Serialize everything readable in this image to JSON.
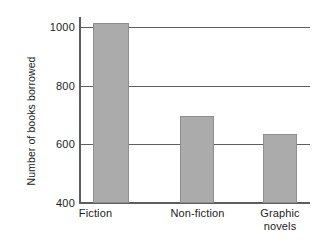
{
  "chart_data": {
    "type": "bar",
    "title": "",
    "xlabel": "",
    "ylabel": "Number of books borrowed",
    "categories": [
      "Fiction",
      "Non-fiction",
      "Graphic novels"
    ],
    "category_lines": [
      [
        "Fiction"
      ],
      [
        "Non-fiction"
      ],
      [
        "Graphic",
        "novels"
      ]
    ],
    "values": [
      1015,
      695,
      635
    ],
    "ylim": [
      400,
      1060
    ],
    "yticks": [
      400,
      600,
      800,
      1000
    ],
    "ytick_labels": [
      "400",
      "600",
      "800",
      "1000"
    ],
    "grid": true,
    "grid_axis": "y",
    "legend": false,
    "legend_position": "none",
    "bar_color": "#ababab",
    "bar_edge_color": "#8e8e8e",
    "axis_color": "#5e5e5e",
    "text_color": "#1c1c1c",
    "background": "#ffffff"
  },
  "axes": {
    "y_title": "Number of books borrowed"
  }
}
